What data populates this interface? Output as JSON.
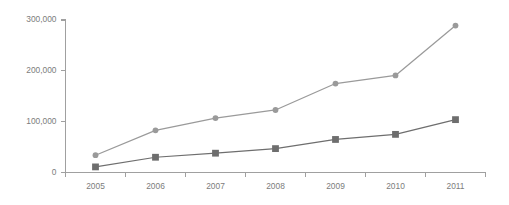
{
  "chart_data": {
    "type": "line",
    "title": "",
    "subtitle": "",
    "xlabel": "",
    "ylabel": "",
    "categories": [
      "2005",
      "2006",
      "2007",
      "2008",
      "2009",
      "2010",
      "2011"
    ],
    "ylim": [
      0,
      300000
    ],
    "ytick_values": [
      0,
      100000,
      200000,
      300000
    ],
    "ytick_labels": [
      "0",
      "100,000",
      "200,000",
      "300,000"
    ],
    "grid": false,
    "legend": "none",
    "series": [
      {
        "name": "series-light",
        "marker": "circle",
        "color": "#9a9a9a",
        "values": [
          34000,
          83000,
          107000,
          123000,
          175000,
          191000,
          289000
        ]
      },
      {
        "name": "series-dark",
        "marker": "square",
        "color": "#6e6e6e",
        "values": [
          11000,
          30000,
          38000,
          47000,
          65000,
          75000,
          104000
        ]
      }
    ],
    "colors": {
      "axis": "#a0a0a0",
      "tick_text": "#7c7c7c",
      "series_light": "#9a9a9a",
      "series_dark": "#6e6e6e",
      "background": "#ffffff"
    }
  }
}
